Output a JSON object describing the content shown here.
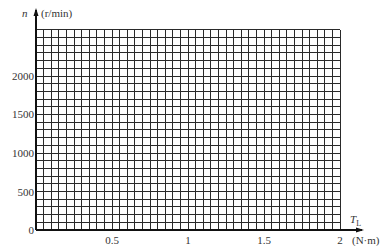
{
  "chart_data": {
    "type": "line",
    "title": "",
    "xlabel": "T_L (N·m)",
    "ylabel": "n (r/min)",
    "x_axis": {
      "symbol": "T",
      "subscript": "L",
      "unit": "(N·m)",
      "ticks": [
        0.5,
        1,
        1.5,
        2
      ],
      "tick_labels": [
        "0.5",
        "1",
        "1.5",
        "2"
      ],
      "range": [
        0,
        2
      ],
      "minor_step": 0.05
    },
    "y_axis": {
      "symbol": "n",
      "unit": "(r/min)",
      "ticks": [
        0,
        500,
        1000,
        1500,
        2000
      ],
      "tick_labels": [
        "0",
        "500",
        "1000",
        "1500",
        "2000"
      ],
      "range": [
        0,
        2600
      ],
      "minor_step": 100
    },
    "grid": true,
    "legend": null,
    "series": []
  },
  "labels": {
    "y_symbol": "n",
    "y_unit": "(r/min)",
    "x_symbol": "T",
    "x_sub": "L",
    "x_unit": "(N·m)",
    "origin": "0",
    "y_ticks": [
      "2000",
      "1500",
      "1000",
      "500"
    ],
    "x_ticks": [
      "0.5",
      "1",
      "1.5",
      "2"
    ]
  },
  "colors": {
    "grid": "#2a2a2a",
    "axis": "#111111",
    "text": "#333333"
  }
}
